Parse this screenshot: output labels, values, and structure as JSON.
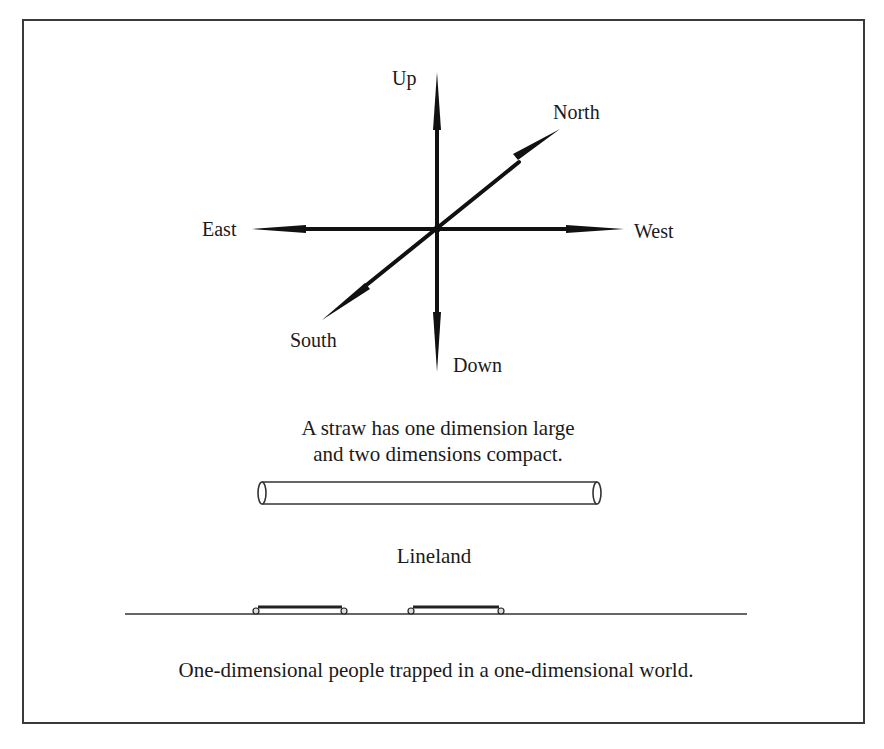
{
  "directions": {
    "up": "Up",
    "down": "Down",
    "north": "North",
    "south": "South",
    "east": "East",
    "west": "West"
  },
  "straw": {
    "caption_line1": "A straw has one dimension large",
    "caption_line2": "and two dimensions compact."
  },
  "lineland": {
    "title": "Lineland",
    "people_count": 2
  },
  "caption": "One-dimensional people trapped in a one-dimensional world.",
  "colors": {
    "ink": "#1a1a1a",
    "frame": "#3a3a3a",
    "background": "#ffffff"
  }
}
